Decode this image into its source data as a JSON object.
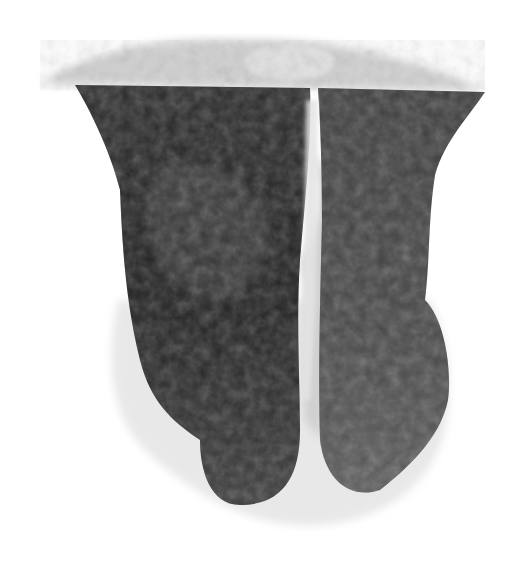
{
  "image": {
    "description": "Grayscale translucent volume rendering of a 3D mesh shape with two dark lobes on a white background",
    "background": "#ffffff",
    "colors": {
      "light_shell": "#d8d8d8",
      "top_cap": "#c4c4c4",
      "left_lobe": "#262626",
      "right_lobe": "#4a4a4a",
      "gap": "#e6e6e6"
    }
  }
}
